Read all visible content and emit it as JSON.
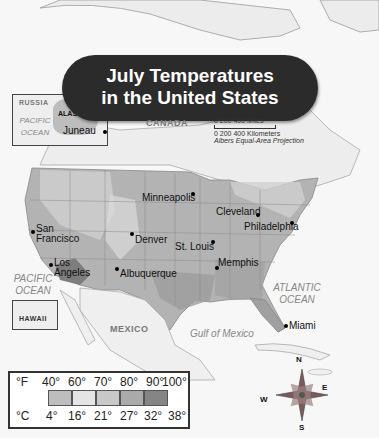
{
  "title": {
    "line1": "July Temperatures",
    "line2": "in the United States"
  },
  "inset_alaska": {
    "russia": "RUSSIA",
    "ocean": "PACIFIC OCEAN",
    "region": "ALASKA",
    "city": "Juneau"
  },
  "inset_hawaii": {
    "region": "HAWAII"
  },
  "countries": {
    "canada": "CANADA",
    "mexico": "MEXICO"
  },
  "water": {
    "pacific": "PACIFIC OCEAN",
    "atlantic": "ATLANTIC OCEAN",
    "gulf": "Gulf of Mexico"
  },
  "cities": [
    {
      "name": "Minneapolis",
      "x": 193,
      "y": 194
    },
    {
      "name": "Cleveland",
      "x": 256,
      "y": 214
    },
    {
      "name": "Philadelphia",
      "x": 291,
      "y": 223
    },
    {
      "name": "San Francisco",
      "x": 32,
      "y": 232
    },
    {
      "name": "Denver",
      "x": 131,
      "y": 233
    },
    {
      "name": "St. Louis",
      "x": 211,
      "y": 241
    },
    {
      "name": "Los Angeles",
      "x": 50,
      "y": 264
    },
    {
      "name": "Albuquerque",
      "x": 116,
      "y": 267
    },
    {
      "name": "Memphis",
      "x": 216,
      "y": 267
    },
    {
      "name": "Miami",
      "x": 284,
      "y": 326
    }
  ],
  "scale": {
    "miles": "0    200    400 Miles",
    "km": "0  200 400 Kilometers",
    "projection": "Albers Equal-Area Projection"
  },
  "legend": {
    "f_label": "°F",
    "c_label": "°C",
    "fahrenheit": [
      "40°",
      "60°",
      "70°",
      "80°",
      "90°",
      "100°"
    ],
    "celsius": [
      "4°",
      "16°",
      "21°",
      "27°",
      "32°",
      "38°"
    ],
    "colors": [
      "#bdbdbd",
      "#e4e4e4",
      "#c8c8c8",
      "#aaaaaa",
      "#858585"
    ]
  },
  "compass": {
    "n": "N",
    "s": "S",
    "e": "E",
    "w": "W"
  }
}
